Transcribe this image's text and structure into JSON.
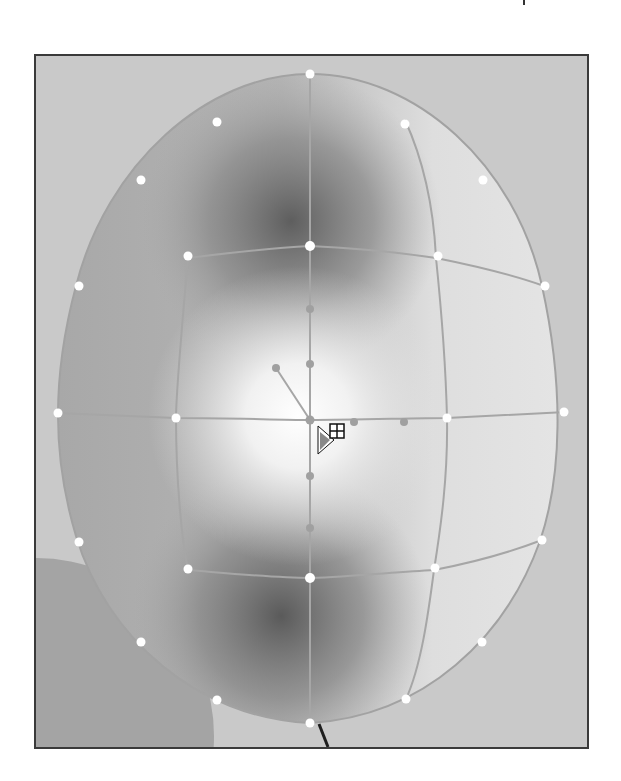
{
  "canvas": {
    "background": "#c9c9c9",
    "frame_color": "#3a3a3a"
  },
  "artwork": {
    "object": "egg-shaped balloon with gradient mesh",
    "fill_colors": {
      "base": "#c2c2c2",
      "shadow": "#6e6e6e",
      "highlight": "#ffffff",
      "right_light": "#e6e6e6"
    },
    "background_circle_color": "#a3a3a3",
    "mesh_line_color": "#a0a0a0",
    "anchor_point_color": "#ffffff",
    "string_color": "#1e1e1e"
  },
  "cursor": {
    "tool": "mesh-tool",
    "glyph": "▶⊞"
  }
}
